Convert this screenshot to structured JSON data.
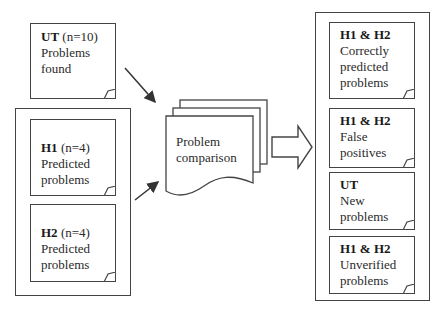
{
  "diagram": {
    "inputs": {
      "ut": {
        "bold": "UT",
        "suffix": " (n=10)",
        "lines": [
          "Problems",
          "found"
        ]
      },
      "heuristic_group": {
        "h1": {
          "bold": "H1",
          "suffix": " (n=4)",
          "lines": [
            "Predicted",
            "problems"
          ]
        },
        "h2": {
          "bold": "H2",
          "suffix": " (n=4)",
          "lines": [
            "Predicted",
            "problems"
          ]
        }
      }
    },
    "process": {
      "lines": [
        "Problem",
        "comparison"
      ]
    },
    "outputs": [
      {
        "bold": "H1 & H2",
        "lines": [
          "Correctly",
          "predicted",
          "problems"
        ]
      },
      {
        "bold": "H1 & H2",
        "lines": [
          "False",
          "positives"
        ]
      },
      {
        "bold": "UT",
        "lines": [
          "New",
          "problems"
        ]
      },
      {
        "bold": "H1 & H2",
        "lines": [
          "Unverified",
          "problems"
        ]
      }
    ],
    "colors": {
      "stroke": "#444444",
      "text": "#2a2a2a",
      "background": "#ffffff"
    }
  }
}
